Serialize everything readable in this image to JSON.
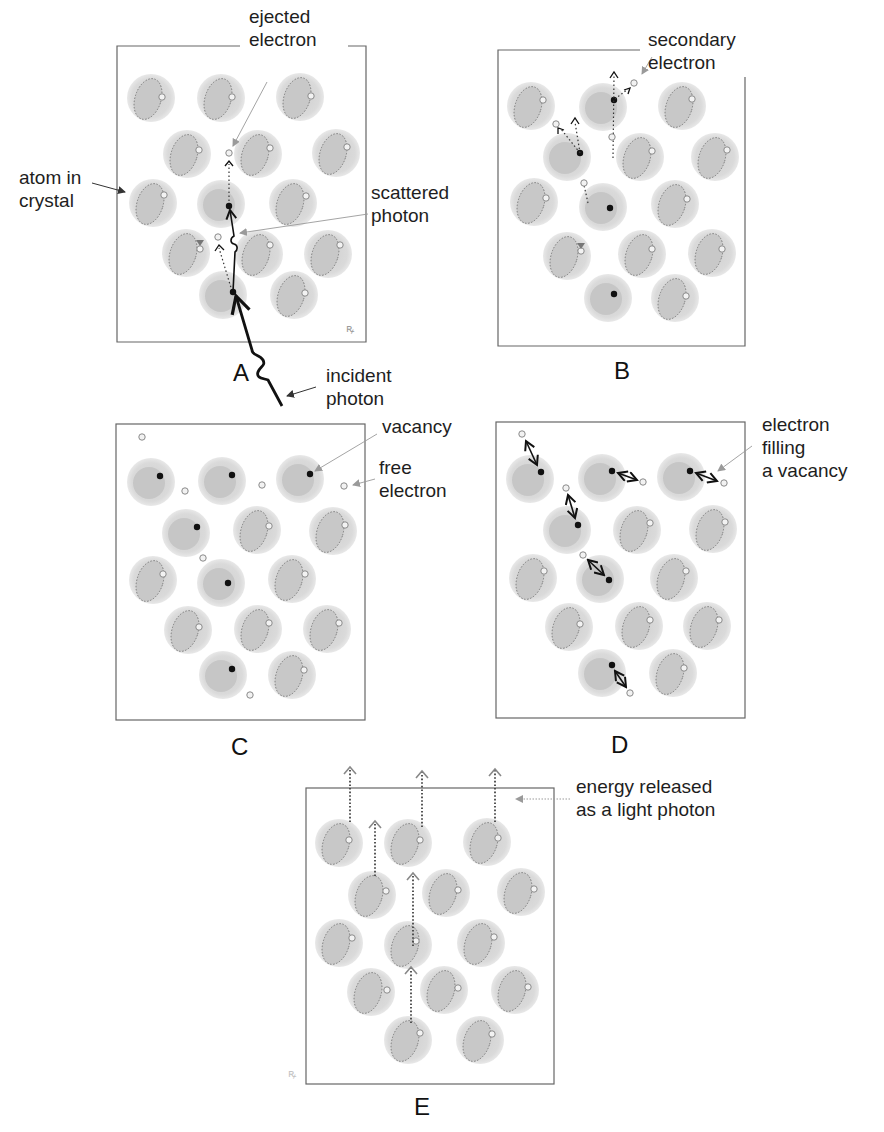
{
  "figure": {
    "title": "",
    "panels": [
      {
        "id": "A",
        "label": "A",
        "box": [
          117,
          46,
          366,
          342
        ],
        "label_pos": [
          245,
          372
        ]
      },
      {
        "id": "B",
        "label": "B",
        "box": [
          498,
          50,
          745,
          346
        ],
        "label_pos": [
          624,
          372
        ]
      },
      {
        "id": "C",
        "label": "C",
        "box": [
          116,
          424,
          365,
          720
        ],
        "label_pos": [
          240,
          748
        ]
      },
      {
        "id": "D",
        "label": "D",
        "box": [
          496,
          422,
          745,
          718
        ],
        "label_pos": [
          620,
          746
        ]
      },
      {
        "id": "E",
        "label": "E",
        "box": [
          306,
          788,
          554,
          1084
        ],
        "label_pos": [
          420,
          1114
        ]
      }
    ],
    "annotations": {
      "ejected_electron": "ejected\nelectron",
      "atom_in_crystal": "atom in\ncrystal",
      "scattered_photon": "scattered\nphoton",
      "incident_photon": "incident\nphoton",
      "secondary_electron": "secondary\nelectron",
      "vacancy": "vacancy",
      "free_electron": "free\nelectron",
      "electron_filling_vacancy": "electron\nfilling\na vacancy",
      "energy_released": "energy released\nas a light photon"
    },
    "colors": {
      "atom_outer": "#dcdcdc",
      "atom_inner": "#c4c4c4",
      "orbit": "#7a7a7a",
      "electron_hollow_fill": "#f2f2f2",
      "electron_hollow_stroke": "#8a8a8a",
      "electron_vacancy": "#111111",
      "arrow": "#111111",
      "pointer": "#9a9a9a",
      "frame": "#555555"
    }
  }
}
